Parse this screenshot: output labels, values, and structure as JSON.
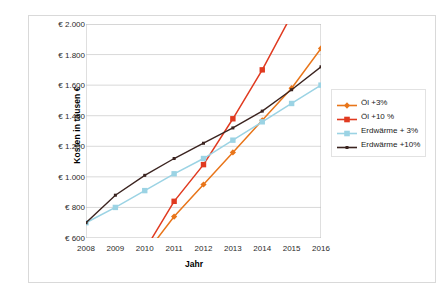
{
  "chart_data": {
    "type": "line",
    "title": "",
    "xlabel": "Jahr",
    "ylabel": "Kosten in tausen €",
    "x": [
      2008,
      2009,
      2010,
      2011,
      2012,
      2013,
      2014,
      2015,
      2016
    ],
    "xticklabels": [
      "2008",
      "2009",
      "2010",
      "2011",
      "2012",
      "2013",
      "2014",
      "2015",
      "2016"
    ],
    "yticklabels": [
      "€ 600",
      "€ 800",
      "€ 1.000",
      "€ 1.200",
      "€ 1.400",
      "€ 1.600",
      "€ 1.800",
      "€ 2.000"
    ],
    "ylim": [
      600,
      2000
    ],
    "ytick_step": 200,
    "xlim": [
      2008,
      2016
    ],
    "grid": "horizontal",
    "legend_position": "right",
    "series": [
      {
        "name": "Öl +3%",
        "color": "#E8751A",
        "marker": "diamond",
        "values": [
          null,
          null,
          490,
          740,
          950,
          1160,
          1370,
          1580,
          1840
        ]
      },
      {
        "name": "Öl +10 %",
        "color": "#E03A20",
        "marker": "square",
        "values": [
          null,
          null,
          520,
          840,
          1080,
          1380,
          1700,
          2060,
          2420
        ]
      },
      {
        "name": "Erdwärme + 3%",
        "color": "#9BD3E4",
        "marker": "square",
        "values": [
          700,
          800,
          910,
          1020,
          1120,
          1240,
          1360,
          1480,
          1600
        ]
      },
      {
        "name": "Erdwärme +10%",
        "color": "#3B2420",
        "marker": "line",
        "values": [
          700,
          880,
          1010,
          1120,
          1220,
          1320,
          1430,
          1570,
          1720
        ]
      }
    ]
  },
  "legend": {
    "items": [
      {
        "label": "Öl +3%"
      },
      {
        "label": "Öl +10 %"
      },
      {
        "label": "Erdwärme + 3%"
      },
      {
        "label": "Erdwärme +10%"
      }
    ]
  },
  "colors": {
    "oil3": "#E8751A",
    "oil10": "#E03A20",
    "geo3": "#9BD3E4",
    "geo10": "#3B2420",
    "grid": "#d9d9d9",
    "frame": "#d9d9d9"
  }
}
